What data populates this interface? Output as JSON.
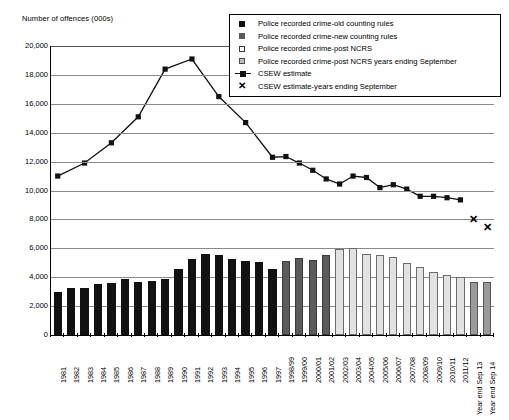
{
  "chart_data": {
    "type": "bar",
    "title": "",
    "ylabel": "Number of offences (000s)",
    "xlabel": "",
    "ylim": [
      0,
      20000
    ],
    "yticks": [
      "0",
      "2,000",
      "4,000",
      "6,000",
      "8,000",
      "10,000",
      "12,000",
      "14,000",
      "16,000",
      "18,000",
      "20,000"
    ],
    "grid": true,
    "legend_position": "top-right",
    "categories": [
      "1981",
      "1982",
      "1983",
      "1984",
      "1985",
      "1986",
      "1987",
      "1988",
      "1989",
      "1990",
      "1991",
      "1992",
      "1993",
      "1994",
      "1995",
      "1996",
      "1997",
      "1998/99",
      "1999/00",
      "2000/01",
      "2001/02",
      "2002/03",
      "2003/04",
      "2004/05",
      "2005/06",
      "2006/07",
      "2007/08",
      "2008/09",
      "2009/10",
      "2010/11",
      "2011/12",
      "Year end Sep 13",
      "Year end Sep 14"
    ],
    "series": [
      {
        "name": "Police recorded crime-old counting rules",
        "type": "bar",
        "color": "#111111",
        "values": [
          2960,
          3260,
          3250,
          3500,
          3610,
          3850,
          3690,
          3710,
          3870,
          4540,
          5280,
          5590,
          5530,
          5250,
          5100,
          5040,
          4600,
          null,
          null,
          null,
          null,
          null,
          null,
          null,
          null,
          null,
          null,
          null,
          null,
          null,
          null,
          null,
          null
        ]
      },
      {
        "name": "Police recorded crime-new counting rules",
        "type": "bar",
        "color": "#5b5b5b",
        "values": [
          null,
          null,
          null,
          null,
          null,
          null,
          null,
          null,
          null,
          null,
          null,
          null,
          null,
          null,
          null,
          null,
          null,
          5110,
          5300,
          5170,
          5530,
          null,
          null,
          null,
          null,
          null,
          null,
          null,
          null,
          null,
          null,
          null,
          null
        ]
      },
      {
        "name": "Police recorded crime-post NCRS",
        "type": "bar",
        "color": "#e2e2e2",
        "values": [
          null,
          null,
          null,
          null,
          null,
          null,
          null,
          null,
          null,
          null,
          null,
          null,
          null,
          null,
          null,
          null,
          null,
          null,
          null,
          null,
          null,
          5975,
          6010,
          5640,
          5560,
          5430,
          4950,
          4700,
          4340,
          4150,
          4040,
          null,
          null
        ]
      },
      {
        "name": "Police recorded crime-post NCRS years ending September",
        "type": "bar",
        "color": "#9a9a9a",
        "values": [
          null,
          null,
          null,
          null,
          null,
          null,
          null,
          null,
          null,
          null,
          null,
          null,
          null,
          null,
          null,
          null,
          null,
          null,
          null,
          null,
          null,
          null,
          null,
          null,
          null,
          null,
          null,
          null,
          null,
          null,
          null,
          3700,
          3700
        ]
      },
      {
        "name": "CSEW estimate",
        "type": "line",
        "color": "#111111",
        "values": [
          11000,
          null,
          11900,
          null,
          13300,
          null,
          15100,
          null,
          18400,
          null,
          19100,
          null,
          16500,
          null,
          14700,
          null,
          12300,
          12350,
          11900,
          11400,
          10800,
          10450,
          11000,
          10900,
          10200,
          10400,
          10100,
          9600,
          9600,
          9500,
          9350,
          null,
          null
        ]
      },
      {
        "name": "CSEW estimate-years ending September",
        "type": "scatter",
        "marker": "x",
        "color": "#111111",
        "values": [
          null,
          null,
          null,
          null,
          null,
          null,
          null,
          null,
          null,
          null,
          null,
          null,
          null,
          null,
          null,
          null,
          null,
          null,
          null,
          null,
          null,
          null,
          null,
          null,
          null,
          null,
          null,
          null,
          null,
          null,
          null,
          8000,
          7500
        ]
      }
    ]
  },
  "legend": {
    "items": [
      {
        "label": "Police recorded crime-old counting rules",
        "marker": "filled-black-square"
      },
      {
        "label": "Police recorded crime-new counting rules",
        "marker": "filled-gray-square"
      },
      {
        "label": "Police recorded crime-post NCRS",
        "marker": "open-square"
      },
      {
        "label": "Police recorded crime-post NCRS years ending September",
        "marker": "light-gray-square"
      },
      {
        "label": "CSEW estimate",
        "marker": "line-with-square"
      },
      {
        "label": "CSEW estimate-years ending September",
        "marker": "x-marker"
      }
    ]
  }
}
